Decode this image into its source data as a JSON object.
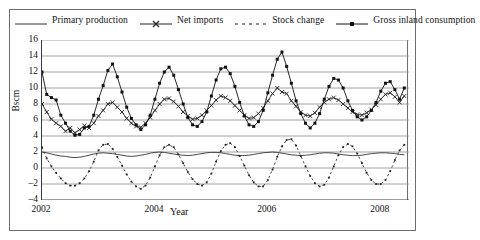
{
  "chart_data": {
    "type": "line",
    "title": "",
    "xlabel": "Year",
    "ylabel": "Bscm",
    "ylim": [
      -4,
      16
    ],
    "ytick_values": [
      16,
      14,
      12,
      10,
      8,
      6,
      4,
      2,
      0,
      -2,
      -4
    ],
    "ytick_labels": [
      "16",
      "14",
      "12",
      "10",
      "8",
      "6",
      "4",
      "2",
      "0",
      "–2",
      "–4"
    ],
    "xlim": [
      2002.0,
      2008.5
    ],
    "xtick_values": [
      2002,
      2004,
      2006,
      2008
    ],
    "xtick_labels": [
      "2002",
      "2004",
      "2006",
      "2008"
    ],
    "x_minor_step": 0.25,
    "grid": "horizontal",
    "legend_position": "top",
    "x": [
      2002.0,
      2002.0833,
      2002.1667,
      2002.25,
      2002.3333,
      2002.4167,
      2002.5,
      2002.5833,
      2002.6667,
      2002.75,
      2002.8333,
      2002.9167,
      2003.0,
      2003.0833,
      2003.1667,
      2003.25,
      2003.3333,
      2003.4167,
      2003.5,
      2003.5833,
      2003.6667,
      2003.75,
      2003.8333,
      2003.9167,
      2004.0,
      2004.0833,
      2004.1667,
      2004.25,
      2004.3333,
      2004.4167,
      2004.5,
      2004.5833,
      2004.6667,
      2004.75,
      2004.8333,
      2004.9167,
      2005.0,
      2005.0833,
      2005.1667,
      2005.25,
      2005.3333,
      2005.4167,
      2005.5,
      2005.5833,
      2005.6667,
      2005.75,
      2005.8333,
      2005.9167,
      2006.0,
      2006.0833,
      2006.1667,
      2006.25,
      2006.3333,
      2006.4167,
      2006.5,
      2006.5833,
      2006.6667,
      2006.75,
      2006.8333,
      2006.9167,
      2007.0,
      2007.0833,
      2007.1667,
      2007.25,
      2007.3333,
      2007.4167,
      2007.5,
      2007.5833,
      2007.6667,
      2007.75,
      2007.8333,
      2007.9167,
      2008.0,
      2008.0833,
      2008.1667,
      2008.25,
      2008.3333,
      2008.4167
    ],
    "series": [
      {
        "name": "Primary production",
        "style": "solid-line",
        "marker": "none",
        "color": "#333333",
        "values": [
          2.0,
          1.9,
          1.75,
          1.6,
          1.5,
          1.45,
          1.35,
          1.3,
          1.35,
          1.45,
          1.6,
          1.75,
          1.85,
          1.9,
          1.85,
          1.8,
          1.7,
          1.6,
          1.5,
          1.45,
          1.5,
          1.6,
          1.7,
          1.85,
          1.95,
          2.0,
          1.95,
          1.85,
          1.75,
          1.65,
          1.6,
          1.55,
          1.6,
          1.7,
          1.8,
          1.9,
          1.95,
          1.95,
          1.9,
          1.8,
          1.7,
          1.6,
          1.55,
          1.55,
          1.6,
          1.7,
          1.8,
          1.9,
          1.95,
          2.0,
          1.95,
          1.85,
          1.75,
          1.65,
          1.6,
          1.55,
          1.6,
          1.65,
          1.75,
          1.85,
          1.9,
          1.9,
          1.85,
          1.75,
          1.65,
          1.6,
          1.55,
          1.55,
          1.6,
          1.7,
          1.8,
          1.85,
          1.9,
          1.9,
          1.85,
          1.8,
          1.7,
          1.65
        ]
      },
      {
        "name": "Net imports",
        "style": "solid-line",
        "marker": "x",
        "color": "#222222",
        "values": [
          8.0,
          7.0,
          6.1,
          5.6,
          5.2,
          4.6,
          5.0,
          4.4,
          4.8,
          5.3,
          5.0,
          5.6,
          6.5,
          7.2,
          8.0,
          8.2,
          7.6,
          7.0,
          6.2,
          5.6,
          5.2,
          5.1,
          5.6,
          6.3,
          7.2,
          8.0,
          8.6,
          8.7,
          8.3,
          7.7,
          7.0,
          6.5,
          6.1,
          6.2,
          6.6,
          7.2,
          7.8,
          8.5,
          9.0,
          8.8,
          8.4,
          7.8,
          7.2,
          6.6,
          6.2,
          6.3,
          6.8,
          7.5,
          8.4,
          9.3,
          10.0,
          9.5,
          9.3,
          8.4,
          7.7,
          7.0,
          6.6,
          6.5,
          6.9,
          7.6,
          8.2,
          8.6,
          8.8,
          8.5,
          8.0,
          7.5,
          7.0,
          6.7,
          6.6,
          6.9,
          7.3,
          7.9,
          8.6,
          9.2,
          9.4,
          8.9,
          8.2,
          9.0
        ]
      },
      {
        "name": "Stock change",
        "style": "dashed",
        "marker": "dot",
        "color": "#222222",
        "values": [
          2.6,
          1.2,
          0.2,
          -0.6,
          -1.3,
          -1.9,
          -2.2,
          -2.2,
          -1.9,
          -1.3,
          -0.4,
          0.8,
          2.2,
          2.9,
          3.0,
          2.4,
          1.4,
          0.3,
          -0.8,
          -1.7,
          -2.3,
          -2.6,
          -2.2,
          -1.2,
          0.2,
          1.6,
          2.6,
          2.9,
          2.6,
          1.7,
          0.6,
          -0.5,
          -1.4,
          -2.0,
          -2.2,
          -1.8,
          -0.7,
          0.8,
          2.1,
          2.9,
          3.1,
          2.6,
          1.5,
          0.3,
          -0.9,
          -1.8,
          -2.3,
          -2.3,
          -1.5,
          -0.2,
          1.4,
          2.7,
          3.5,
          3.6,
          2.8,
          1.5,
          0.2,
          -1.0,
          -1.9,
          -2.3,
          -2.1,
          -1.2,
          0.2,
          1.6,
          2.6,
          3.0,
          2.7,
          1.8,
          0.6,
          -0.6,
          -1.5,
          -2.0,
          -2.0,
          -1.5,
          -0.4,
          1.0,
          2.2,
          2.9
        ]
      },
      {
        "name": "Gross inland consumption",
        "style": "solid-line",
        "marker": "square",
        "color": "#111111",
        "values": [
          12.0,
          9.2,
          8.8,
          8.5,
          6.6,
          5.6,
          4.6,
          4.1,
          4.2,
          5.0,
          5.2,
          6.6,
          8.6,
          10.3,
          12.2,
          13.0,
          11.4,
          9.5,
          7.6,
          6.2,
          5.4,
          4.8,
          5.4,
          6.6,
          8.6,
          10.6,
          12.0,
          12.6,
          11.6,
          9.8,
          8.0,
          6.3,
          5.4,
          5.2,
          5.8,
          7.0,
          9.0,
          11.0,
          12.4,
          12.6,
          11.8,
          10.2,
          8.2,
          6.5,
          5.4,
          5.2,
          5.8,
          7.2,
          9.4,
          11.6,
          13.6,
          14.5,
          12.7,
          10.6,
          8.4,
          6.8,
          5.6,
          5.0,
          5.6,
          6.8,
          8.6,
          10.2,
          11.2,
          11.0,
          10.0,
          8.4,
          7.2,
          6.4,
          6.0,
          6.4,
          7.2,
          8.2,
          9.6,
          10.6,
          10.8,
          9.8,
          8.6,
          10.0
        ]
      }
    ]
  },
  "legend": {
    "items": [
      {
        "label": "Primary production",
        "sample": "solid-line"
      },
      {
        "label": "Net imports",
        "sample": "line-x-marker"
      },
      {
        "label": "Stock change",
        "sample": "dashed-dots"
      },
      {
        "label": "Gross inland consumption",
        "sample": "line-square-marker"
      }
    ]
  },
  "axes": {
    "y_title": "Bscm",
    "x_title": "Year"
  },
  "colors": {
    "frame": "#6d6d6d",
    "gridline": "#8a8a8a",
    "axis": "#3a3a3a",
    "ink": "#111111",
    "background": "#ffffff"
  }
}
